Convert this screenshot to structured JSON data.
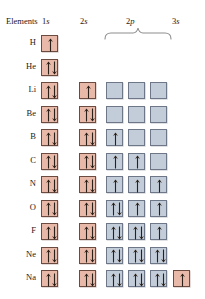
{
  "figure": {
    "colors": {
      "s_box_fill": "#e8b9a8",
      "s_box_border": "#6b4a3f",
      "p_box_fill": "#c3ccd9",
      "p_box_border": "#6e7787",
      "arrow_dark": "#2b2118",
      "text": "#1a1a1a",
      "background": "#ffffff"
    }
  },
  "header": {
    "elements_label": "Elements",
    "col_1s": "1s",
    "col_2s": "2s",
    "col_2p": "2p",
    "col_3s": "3s",
    "brace_icon": "curly-brace-icon"
  },
  "chart_data": {
    "type": "table",
    "columns": [
      "Elements",
      "1s",
      "2s",
      "2p",
      "2p",
      "2p",
      "3s"
    ],
    "orbital_groups": [
      {
        "name": "1s",
        "boxes": 1,
        "kind": "s"
      },
      {
        "name": "2s",
        "boxes": 1,
        "kind": "s"
      },
      {
        "name": "2p",
        "boxes": 3,
        "kind": "p"
      },
      {
        "name": "3s",
        "boxes": 1,
        "kind": "s"
      }
    ],
    "legend": {
      "up_arrow": "spin-up electron",
      "down_arrow": "spin-down electron",
      "empty_box": "unoccupied orbital"
    },
    "rows": [
      {
        "element": "H",
        "atomic_number": 1,
        "config": "1s1",
        "one_s": "up",
        "two_s": null,
        "two_p": [
          null,
          null,
          null
        ],
        "three_s": null
      },
      {
        "element": "He",
        "atomic_number": 2,
        "config": "1s2",
        "one_s": "pair",
        "two_s": null,
        "two_p": [
          null,
          null,
          null
        ],
        "three_s": null
      },
      {
        "element": "Li",
        "atomic_number": 3,
        "config": "1s2 2s1",
        "one_s": "pair",
        "two_s": "up",
        "two_p": [
          "empty",
          "empty",
          "empty"
        ],
        "three_s": null
      },
      {
        "element": "Be",
        "atomic_number": 4,
        "config": "1s2 2s2",
        "one_s": "pair",
        "two_s": "pair",
        "two_p": [
          "empty",
          "empty",
          "empty"
        ],
        "three_s": null
      },
      {
        "element": "B",
        "atomic_number": 5,
        "config": "1s2 2s2 2p1",
        "one_s": "pair",
        "two_s": "pair",
        "two_p": [
          "up",
          "empty",
          "empty"
        ],
        "three_s": null
      },
      {
        "element": "C",
        "atomic_number": 6,
        "config": "1s2 2s2 2p2",
        "one_s": "pair",
        "two_s": "pair",
        "two_p": [
          "up",
          "up",
          "empty"
        ],
        "three_s": null
      },
      {
        "element": "N",
        "atomic_number": 7,
        "config": "1s2 2s2 2p3",
        "one_s": "pair",
        "two_s": "pair",
        "two_p": [
          "up",
          "up",
          "up"
        ],
        "three_s": null
      },
      {
        "element": "O",
        "atomic_number": 8,
        "config": "1s2 2s2 2p4",
        "one_s": "pair",
        "two_s": "pair",
        "two_p": [
          "pair",
          "up",
          "up"
        ],
        "three_s": null
      },
      {
        "element": "F",
        "atomic_number": 9,
        "config": "1s2 2s2 2p5",
        "one_s": "pair",
        "two_s": "pair",
        "two_p": [
          "pair",
          "pair",
          "up"
        ],
        "three_s": null
      },
      {
        "element": "Ne",
        "atomic_number": 10,
        "config": "1s2 2s2 2p6",
        "one_s": "pair",
        "two_s": "pair",
        "two_p": [
          "pair",
          "pair",
          "pair"
        ],
        "three_s": null
      },
      {
        "element": "Na",
        "atomic_number": 11,
        "config": "1s2 2s2 2p6 3s1",
        "one_s": "pair",
        "two_s": "pair",
        "two_p": [
          "pair",
          "pair",
          "pair"
        ],
        "three_s": "up"
      }
    ]
  }
}
